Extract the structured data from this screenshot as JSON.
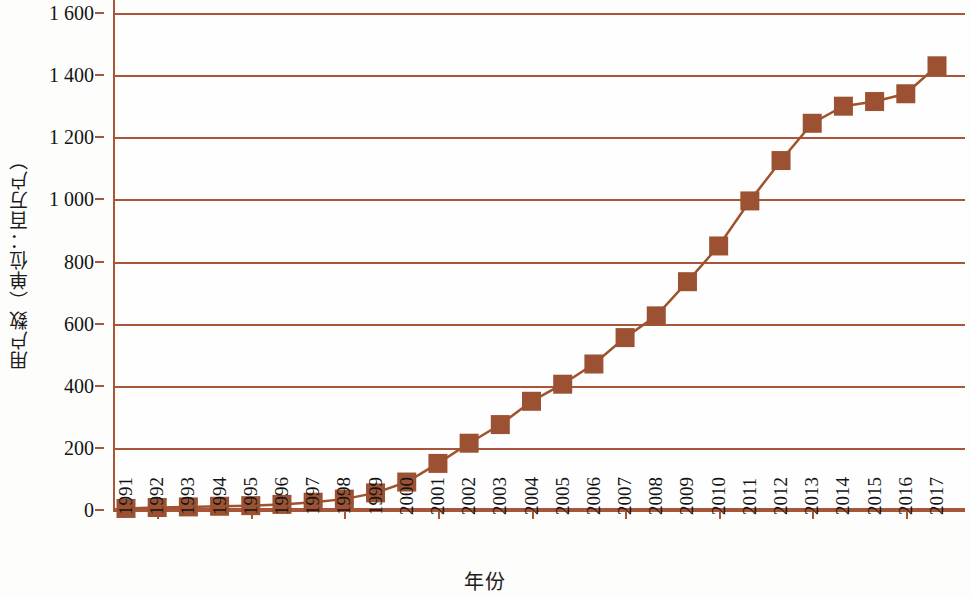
{
  "chart_data": {
    "type": "line",
    "title": "",
    "subtitle": "",
    "xlabel": "年份",
    "ylabel": "用户数（单位：百万户）",
    "marker": "square",
    "grid": true,
    "legend": "none",
    "line_color": "#a0522d",
    "marker_color": "#9c5232",
    "axis_color": "#a8563a",
    "xlim": [
      "1991",
      "2017"
    ],
    "ylim": [
      0,
      1600
    ],
    "ytick_labels": [
      "1 600",
      "1 400",
      "1 200",
      "1 000",
      "800",
      "600",
      "400",
      "200",
      "0"
    ],
    "ytick_values": [
      1600,
      1400,
      1200,
      1000,
      800,
      600,
      400,
      200,
      0
    ],
    "ytick_step": 200,
    "categories": [
      "1991",
      "1992",
      "1993",
      "1994",
      "1995",
      "1996",
      "1997",
      "1998",
      "1999",
      "2000",
      "2001",
      "2002",
      "2003",
      "2004",
      "2005",
      "2006",
      "2007",
      "2008",
      "2009",
      "2010",
      "2011",
      "2012",
      "2013",
      "2014",
      "2015",
      "2016",
      "2017"
    ],
    "values": [
      5,
      8,
      10,
      12,
      14,
      18,
      25,
      35,
      55,
      90,
      150,
      215,
      275,
      350,
      405,
      470,
      555,
      625,
      735,
      850,
      995,
      1125,
      1245,
      1300,
      1315,
      1340,
      1430
    ],
    "units": "百万户"
  }
}
